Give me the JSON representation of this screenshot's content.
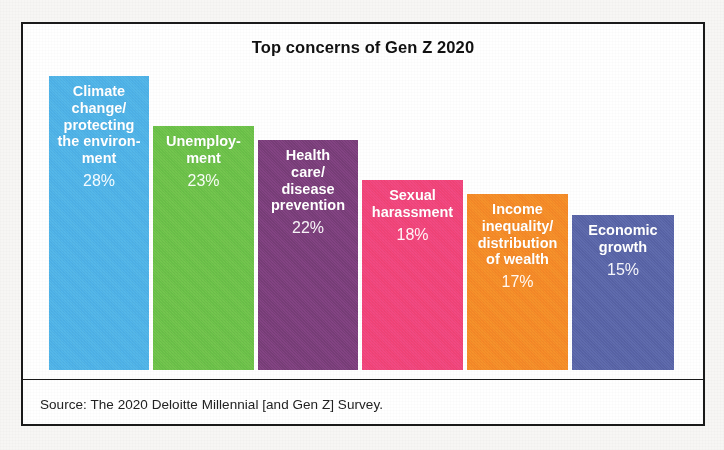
{
  "figure": {
    "title": "Top concerns of Gen Z 2020",
    "source": "Source: The 2020 Deloitte Millennial [and Gen Z] Survey."
  },
  "chart_data": {
    "type": "bar",
    "title": "Top concerns of Gen Z 2020",
    "subtitle": "",
    "xlabel": "",
    "ylabel": "",
    "unit": "%",
    "grid": false,
    "legend": "none",
    "orientation": "vertical",
    "ylim": [
      0,
      31
    ],
    "categories": [
      "Climate change/ protecting the environment",
      "Unemployment",
      "Health care/ disease prevention",
      "Sexual harassment",
      "Income inequality/ distribution of wealth",
      "Economic growth"
    ],
    "values": [
      28,
      23,
      22,
      18,
      17,
      15
    ],
    "value_labels": [
      "28%",
      "23%",
      "22%",
      "18%",
      "17%",
      "15%"
    ],
    "colors": [
      "#4FB3E8",
      "#6CC24A",
      "#7B3F7B",
      "#F2457A",
      "#F68B28",
      "#5A65A8"
    ],
    "bars": [
      {
        "label": "Climate\nchange/\nprotecting\nthe environ-\nment",
        "category": "Climate change/ protecting the environment",
        "value": 28,
        "value_label": "28%",
        "color": "#4FB3E8"
      },
      {
        "label": "Unemploy-\nment",
        "category": "Unemployment",
        "value": 23,
        "value_label": "23%",
        "color": "#6CC24A"
      },
      {
        "label": "Health\ncare/\ndisease\nprevention",
        "category": "Health care/ disease prevention",
        "value": 22,
        "value_label": "22%",
        "color": "#7B3F7B"
      },
      {
        "label": "Sexual\nharassment",
        "category": "Sexual harassment",
        "value": 18,
        "value_label": "18%",
        "color": "#F2457A"
      },
      {
        "label": "Income\ninequality/\ndistribution\nof wealth",
        "category": "Income inequality/ distribution of wealth",
        "value": 17,
        "value_label": "17%",
        "color": "#F68B28"
      },
      {
        "label": "Economic\ngrowth",
        "category": "Economic growth",
        "value": 15,
        "value_label": "15%",
        "color": "#5A65A8"
      }
    ]
  },
  "layout": {
    "bar_geometry": [
      {
        "left": 26,
        "width": 100,
        "top": 52,
        "height": 294
      },
      {
        "left": 130,
        "width": 101,
        "top": 102,
        "height": 244
      },
      {
        "left": 235,
        "width": 100,
        "top": 116,
        "height": 230
      },
      {
        "left": 339,
        "width": 101,
        "top": 156,
        "height": 190
      },
      {
        "left": 444,
        "width": 101,
        "top": 170,
        "height": 176
      },
      {
        "left": 549,
        "width": 102,
        "top": 191,
        "height": 155
      }
    ]
  }
}
